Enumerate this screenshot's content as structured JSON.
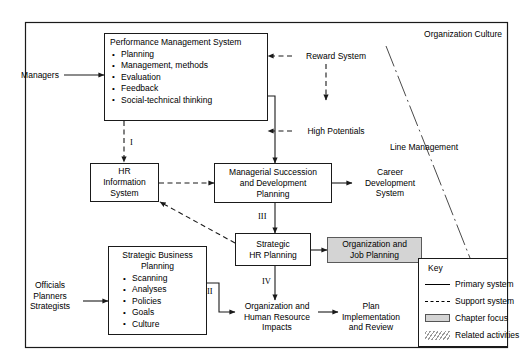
{
  "diagram": {
    "frame_label": "Organization Culture",
    "side_label": "Line Management"
  },
  "actors": {
    "managers": "Managers",
    "officials_planners_strategists": "Officials\nPlanners\nStrategists"
  },
  "nodes": {
    "performance_management_system": {
      "title": "Performance Management System",
      "bullets": [
        "Planning",
        "Management, methods",
        "Evaluation",
        "Feedback",
        "Social-technical thinking"
      ]
    },
    "hr_information_system": {
      "title": "HR\nInformation\nSystem"
    },
    "managerial_succession": {
      "title": "Managerial Succession\nand Development\nPlanning"
    },
    "strategic_hr_planning": {
      "title": "Strategic\nHR Planning"
    },
    "strategic_business_planning": {
      "title": "Strategic Business\nPlanning",
      "bullets": [
        "Scanning",
        "Analyses",
        "Policies",
        "Goals",
        "Culture"
      ]
    },
    "organization_job_planning": {
      "title": "Organization and\nJob Planning"
    },
    "career_development_system": {
      "title": "Career\nDevelopment\nSystem"
    },
    "organization_hr_impacts": {
      "title": "Organization and\nHuman Resource\nImpacts"
    },
    "plan_implementation_review": {
      "title": "Plan\nImplementation\nand Review"
    }
  },
  "flow_labels": {
    "reward_system": "Reward System",
    "high_potentials": "High Potentials"
  },
  "step_numerals": {
    "i": "I",
    "ii": "II",
    "iii": "III",
    "iv": "IV"
  },
  "key": {
    "title": "Key",
    "entries": [
      {
        "symbol": "solid-line",
        "label": "Primary system"
      },
      {
        "symbol": "dashed-line",
        "label": "Support system"
      },
      {
        "symbol": "shaded-box",
        "label": "Chapter focus"
      },
      {
        "symbol": "hatched-box",
        "label": "Related activities"
      }
    ]
  },
  "colors": {
    "line": "#1a1a1a",
    "shaded_fill": "#d4d4d4",
    "background": "#ffffff"
  }
}
